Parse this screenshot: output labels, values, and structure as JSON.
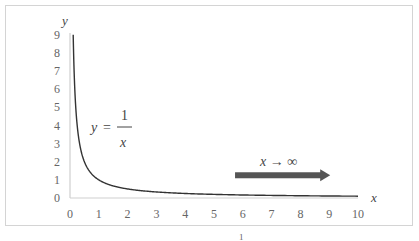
{
  "chart_data": {
    "type": "line",
    "title": "",
    "xlabel": "x",
    "ylabel": "y",
    "xlim": [
      0,
      10
    ],
    "ylim": [
      0,
      9
    ],
    "xticks": [
      "0",
      "1",
      "2",
      "3",
      "4",
      "5",
      "6",
      "7",
      "8",
      "9",
      "10"
    ],
    "yticks": [
      "0",
      "1",
      "2",
      "3",
      "4",
      "5",
      "6",
      "7",
      "8",
      "9"
    ],
    "grid": false,
    "legend": "none",
    "series": [
      {
        "name": "y = 1/x",
        "function": "1/x",
        "x_range": [
          0.111,
          10
        ],
        "color": "#333333"
      }
    ],
    "annotations": [
      {
        "text_lhs": "y",
        "text_eq": "=",
        "frac_num": "1",
        "frac_den": "x",
        "position": "upper-left"
      },
      {
        "text": "x → ∞",
        "arrow_from_x": 5.8,
        "arrow_to_x": 9.0,
        "arrow_y": 1.2,
        "arrow_color": "#555555"
      }
    ]
  },
  "footer": {
    "page_number": "1"
  }
}
